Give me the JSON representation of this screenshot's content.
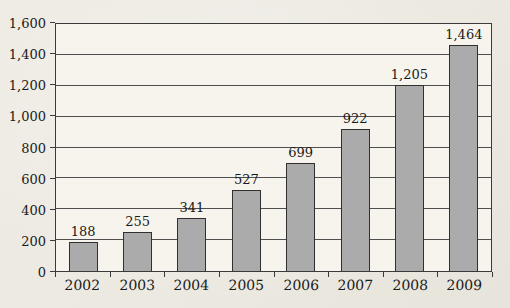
{
  "chart_data": {
    "type": "bar",
    "title": "",
    "xlabel": "",
    "ylabel": "",
    "categories": [
      "2002",
      "2003",
      "2004",
      "2005",
      "2006",
      "2007",
      "2008",
      "2009"
    ],
    "values": [
      188,
      255,
      341,
      527,
      699,
      922,
      1205,
      1464
    ],
    "value_labels": [
      "188",
      "255",
      "341",
      "527",
      "699",
      "922",
      "1,205",
      "1,464"
    ],
    "ylim": [
      0,
      1600
    ],
    "ytick_step": 200,
    "ytick_labels": [
      "0",
      "200",
      "400",
      "600",
      "800",
      "1,000",
      "1,200",
      "1,400",
      "1,600"
    ],
    "grid": true,
    "legend": "none",
    "colors": {
      "bar_fill": "#ababab",
      "bar_border": "#303030",
      "gridline": "#4f4f4f",
      "frame": "#3a3a3a",
      "plot_background": "#f6f4ed",
      "page_background": "#ece9e1",
      "text": "#1b1b1b"
    }
  }
}
